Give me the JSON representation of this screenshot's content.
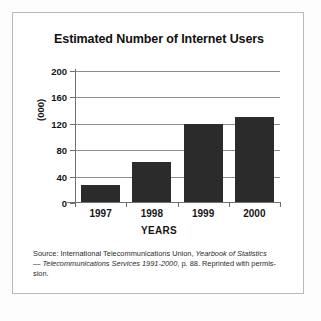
{
  "chart_data": {
    "type": "bar",
    "title": "Estimated Number of Internet Users",
    "xlabel": "YEARS",
    "ylabel": "(000)",
    "categories": [
      "1997",
      "1998",
      "1999",
      "2000"
    ],
    "values": [
      27,
      62,
      120,
      131
    ],
    "ylim": [
      0,
      200
    ],
    "yticks": [
      0,
      40,
      80,
      120,
      160,
      200
    ],
    "ytick_labels": [
      "0",
      "40",
      "80",
      "120",
      "160",
      "200"
    ],
    "grid": true,
    "legend": null,
    "series": [
      {
        "name": "Internet users",
        "values": [
          27,
          62,
          120,
          131
        ]
      }
    ],
    "bar_color": "#2b2b2b",
    "gridline_color": "#8d8d8d",
    "axis_color": "#6f6f6f"
  },
  "source_note": {
    "line1_a": "Source: International Telecommunications Union, ",
    "line1_italic": "Yearbook of Statistics",
    "line2_dash": "— ",
    "line2_italic": "Telecommunications Services 1991-2000",
    "line2_b": ", p. 88. Reprinted with permis-",
    "line3": "sion."
  }
}
